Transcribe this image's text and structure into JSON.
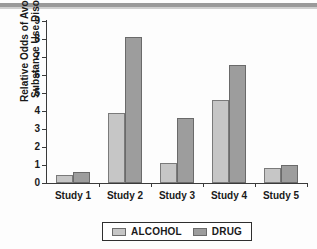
{
  "chart_data": {
    "type": "bar",
    "title": "",
    "xlabel": "",
    "ylabel_lines": [
      "Relative Odds of Avoiding",
      "Substance Use Disorder"
    ],
    "ylabel": "Relative Odds of Avoiding Substance Use Disorder",
    "categories": [
      "Study 1",
      "Study 2",
      "Study 3",
      "Study 4",
      "Study 5"
    ],
    "series": [
      {
        "name": "ALCOHOL",
        "color": "#c6c6c6",
        "values": [
          0.45,
          3.9,
          1.1,
          4.6,
          0.85
        ]
      },
      {
        "name": "DRUG",
        "color": "#9d9d9d",
        "values": [
          0.6,
          8.1,
          3.6,
          6.55,
          1.0
        ]
      }
    ],
    "ylim": [
      0,
      9
    ],
    "ytick_labels": [
      "0",
      "1",
      "2",
      "3",
      "4",
      "5",
      "6",
      "7",
      "8",
      "9"
    ],
    "ytick_values": [
      0,
      1,
      2,
      3,
      4,
      5,
      6,
      7,
      8,
      9
    ],
    "grid": false,
    "legend_position": "bottom-center",
    "legend_entries": [
      "ALCOHOL",
      "DRUG"
    ]
  }
}
